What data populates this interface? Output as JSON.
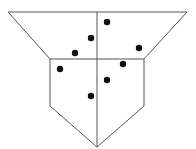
{
  "diagram": {
    "stroke_color": "#555555",
    "dot_color": "#111111",
    "stroke_width": 1,
    "dot_radius": 3.2,
    "outline": {
      "points": [
        [
          8,
          12
        ],
        [
          187,
          12
        ],
        [
          144,
          59
        ],
        [
          144,
          106
        ],
        [
          97,
          147
        ],
        [
          50,
          106
        ],
        [
          50,
          59
        ]
      ]
    },
    "divider_horizontal": {
      "x1": 50,
      "y1": 59,
      "x2": 144,
      "y2": 59
    },
    "divider_vertical": {
      "x1": 97,
      "y1": 12,
      "x2": 97,
      "y2": 147
    },
    "dots": [
      {
        "x": 107,
        "y": 22
      },
      {
        "x": 91,
        "y": 38
      },
      {
        "x": 75,
        "y": 53
      },
      {
        "x": 139,
        "y": 48
      },
      {
        "x": 60,
        "y": 69
      },
      {
        "x": 123,
        "y": 64
      },
      {
        "x": 107,
        "y": 80
      },
      {
        "x": 91,
        "y": 96
      }
    ]
  }
}
